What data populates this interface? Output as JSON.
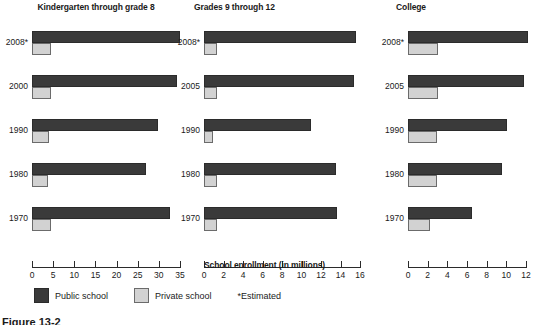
{
  "axis_caption": "School enrollment (in millions)",
  "legend": {
    "public_label": "Public school",
    "private_label": "Private school",
    "estimated_note": "*Estimated"
  },
  "figure_caption": "Figure  13-2",
  "colors": {
    "public": "#3a3a3a",
    "private": "#d2d2d2",
    "private_border": "#6b6b6b",
    "axis": "#2b2b2b",
    "text": "#1a1a1a",
    "background": "#ffffff"
  },
  "chart_data": [
    {
      "type": "bar",
      "title": "Kindergarten through grade 8",
      "xlabel": "School enrollment (in millions)",
      "ylabel": "",
      "orientation": "horizontal",
      "grid": false,
      "xlim": [
        0,
        35
      ],
      "xticks": [
        0,
        5,
        10,
        15,
        20,
        25,
        30,
        35
      ],
      "xtick_labels": [
        "0",
        "5",
        "10",
        "15",
        "20",
        "25",
        "30",
        "35"
      ],
      "categories": [
        "2008*",
        "2000",
        "1990",
        "1980",
        "1970"
      ],
      "series": [
        {
          "name": "Public school",
          "values": [
            34.9,
            34.2,
            29.9,
            27.0,
            32.6
          ]
        },
        {
          "name": "Private school",
          "values": [
            4.4,
            4.4,
            4.1,
            3.7,
            4.4
          ]
        }
      ]
    },
    {
      "type": "bar",
      "title": "Grades 9 through 12",
      "xlabel": "School enrollment (in millions)",
      "ylabel": "",
      "orientation": "horizontal",
      "grid": false,
      "xlim": [
        0,
        16
      ],
      "xticks": [
        0,
        2,
        4,
        6,
        8,
        10,
        12,
        14,
        16
      ],
      "xtick_labels": [
        "0",
        "2",
        "4",
        "6",
        "8",
        "10",
        "12",
        "14",
        "16"
      ],
      "categories": [
        "2008*",
        "2005",
        "1990",
        "1980",
        "1970"
      ],
      "series": [
        {
          "name": "Public school",
          "values": [
            15.6,
            15.4,
            11.0,
            13.5,
            13.6
          ]
        },
        {
          "name": "Private school",
          "values": [
            1.3,
            1.3,
            0.9,
            1.3,
            1.3
          ]
        }
      ]
    },
    {
      "type": "bar",
      "title": "College",
      "xlabel": "School enrollment (in millions)",
      "ylabel": "",
      "orientation": "horizontal",
      "grid": false,
      "xlim": [
        0,
        12
      ],
      "xticks": [
        0,
        2,
        4,
        6,
        8,
        10,
        12
      ],
      "xtick_labels": [
        "0",
        "2",
        "4",
        "6",
        "8",
        "10",
        "12"
      ],
      "categories": [
        "2008*",
        "2005",
        "1990",
        "1980",
        "1970"
      ],
      "series": [
        {
          "name": "Public school",
          "values": [
            12.2,
            11.8,
            10.1,
            9.6,
            6.5
          ]
        },
        {
          "name": "Private school",
          "values": [
            3.1,
            3.1,
            2.9,
            2.9,
            2.2
          ]
        }
      ]
    }
  ]
}
